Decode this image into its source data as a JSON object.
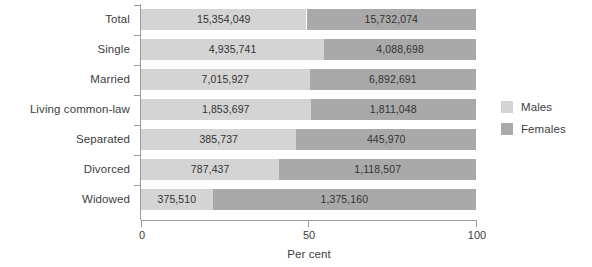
{
  "chart_data": {
    "type": "bar",
    "orientation": "horizontal",
    "stacked": true,
    "normalized_percent": true,
    "title": "",
    "xlabel": "Per cent",
    "ylabel": "",
    "xlim": [
      0,
      100
    ],
    "xticks": [
      0,
      50,
      100
    ],
    "xtick_labels": [
      "0",
      "50",
      "100"
    ],
    "grid": false,
    "legend_position": "right",
    "categories": [
      "Total",
      "Single",
      "Married",
      "Living common-law",
      "Separated",
      "Divorced",
      "Widowed"
    ],
    "series": [
      {
        "name": "Males",
        "color": "#d4d4d4",
        "values": [
          15354049,
          4935741,
          7015927,
          1853697,
          385737,
          787437,
          375510
        ],
        "labels": [
          "15,354,049",
          "4,935,741",
          "7,015,927",
          "1,853,697",
          "385,737",
          "787,437",
          "375,510"
        ],
        "percents": [
          49.4,
          54.7,
          50.4,
          50.6,
          46.4,
          41.3,
          21.4
        ]
      },
      {
        "name": "Females",
        "color": "#a9a9a9",
        "values": [
          15732074,
          4088698,
          6892691,
          1811048,
          445970,
          1118507,
          1375160
        ],
        "labels": [
          "15,732,074",
          "4,088,698",
          "6,892,691",
          "1,811,048",
          "445,970",
          "1,118,507",
          "1,375,160"
        ],
        "percents": [
          50.6,
          45.3,
          49.6,
          49.4,
          53.6,
          58.7,
          78.6
        ]
      }
    ]
  },
  "legend": {
    "items": [
      {
        "label": "Males",
        "color": "#d4d4d4"
      },
      {
        "label": "Females",
        "color": "#a9a9a9"
      }
    ]
  },
  "axis": {
    "x_title": "Per cent",
    "tick_0": "0",
    "tick_50": "50",
    "tick_100": "100"
  }
}
